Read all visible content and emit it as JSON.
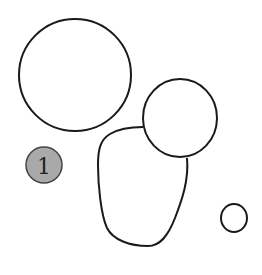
{
  "diagram": {
    "type": "shapes-sketch",
    "stroke_color": "#1a1a1a",
    "background": "#ffffff",
    "shapes": [
      {
        "id": "large-ellipse",
        "kind": "ellipse",
        "cx": 75,
        "cy": 75,
        "rx": 56,
        "ry": 56
      },
      {
        "id": "medium-circle",
        "kind": "circle",
        "cx": 180,
        "cy": 118,
        "r": 37
      },
      {
        "id": "blob",
        "kind": "freeform"
      },
      {
        "id": "small-circle",
        "kind": "circle",
        "cx": 234,
        "cy": 218,
        "r": 13
      }
    ],
    "badge": {
      "label": "1",
      "fill": "#a9a9a9",
      "stroke": "#444444",
      "cx": 44,
      "cy": 165,
      "r": 18
    }
  }
}
